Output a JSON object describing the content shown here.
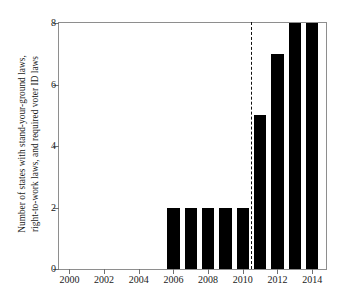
{
  "chart_data": {
    "type": "bar",
    "title": "",
    "xlabel": "",
    "ylabel_lines": [
      "Number of states with stand-your-ground laws,",
      "right-to-work laws, and required voter ID laws"
    ],
    "ylabel": "Number of states with stand-your-ground laws, right-to-work laws, and required voter ID laws",
    "categories": [
      2000,
      2001,
      2002,
      2003,
      2004,
      2005,
      2006,
      2007,
      2008,
      2009,
      2010,
      2011,
      2012,
      2013,
      2014
    ],
    "values": [
      0,
      0,
      0,
      0,
      0,
      0,
      2,
      2,
      2,
      2,
      2,
      5,
      7,
      8,
      8
    ],
    "xticks": [
      2000,
      2002,
      2004,
      2006,
      2008,
      2010,
      2012,
      2014
    ],
    "xtick_labels": [
      "2000",
      "2002",
      "2004",
      "2006",
      "2008",
      "2010",
      "2012",
      "2014"
    ],
    "yticks": [
      0,
      2,
      4,
      6,
      8
    ],
    "ytick_labels": [
      "0",
      "2",
      "4",
      "6",
      "8"
    ],
    "xlim": [
      1999.4,
      2014.8
    ],
    "ylim": [
      0,
      8.0
    ],
    "grid": false,
    "legend": null,
    "bar_color": "#000000",
    "annotations": [
      {
        "type": "vertical-dashed-line",
        "x": 2010.5,
        "label": "",
        "color": "#111111"
      }
    ]
  }
}
